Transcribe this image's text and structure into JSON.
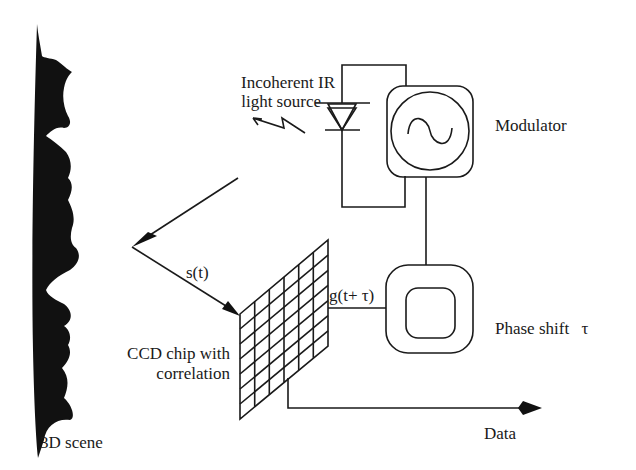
{
  "diagram": {
    "nodes": [
      {
        "id": "scene",
        "label": "3D scene"
      },
      {
        "id": "light_source",
        "label_line1": "Incoherent IR",
        "label_line2": "light source"
      },
      {
        "id": "modulator",
        "label": "Modulator",
        "icon": "sine-wave-icon"
      },
      {
        "id": "phase_shift",
        "label": "Phase shift",
        "symbol": "τ"
      },
      {
        "id": "ccd",
        "label_line1": "CCD chip with",
        "label_line2": "correlation"
      },
      {
        "id": "output",
        "label": "Data"
      }
    ],
    "signals": {
      "reflected": "s(t)",
      "reference": "g(t+ τ)"
    },
    "edges": [
      {
        "from": "modulator",
        "to": "light_source"
      },
      {
        "from": "light_source",
        "to": "scene",
        "style": "arrow"
      },
      {
        "from": "scene",
        "to": "ccd",
        "label": "s(t)",
        "style": "arrow"
      },
      {
        "from": "modulator",
        "to": "phase_shift"
      },
      {
        "from": "phase_shift",
        "to": "ccd",
        "label": "g(t+ τ)"
      },
      {
        "from": "ccd",
        "to": "output",
        "style": "arrow"
      }
    ],
    "grid": {
      "columns": 6,
      "rows": 7
    },
    "colors": {
      "ink": "#1a1a1a",
      "background": "#ffffff"
    }
  }
}
